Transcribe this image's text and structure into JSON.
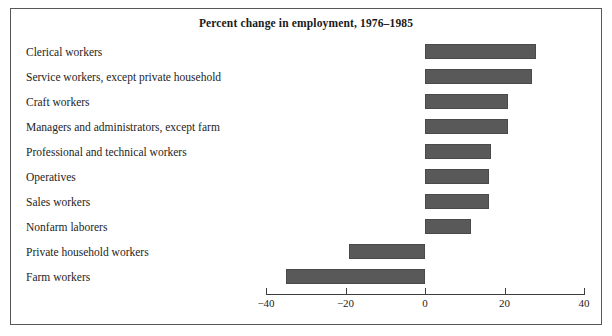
{
  "figure": {
    "title": "Percent change in employment, 1976–1985",
    "bar_color": "#595959",
    "frame_color": "#585858",
    "background": "#ffffff"
  },
  "chart_data": {
    "type": "bar",
    "orientation": "horizontal",
    "title": "Percent change in employment, 1976–1985",
    "xlabel": "",
    "ylabel": "",
    "xlim": [
      -40,
      40
    ],
    "grid": false,
    "legend": false,
    "xticks": [
      -40,
      -20,
      0,
      20,
      40
    ],
    "xtick_labels": [
      "−40",
      "−20",
      "0",
      "20",
      "40"
    ],
    "categories": [
      "Clerical workers",
      "Service workers, except private household",
      "Craft workers",
      "Managers and administrators, except farm",
      "Professional and technical workers",
      "Operatives",
      "Sales workers",
      "Nonfarm laborers",
      "Private household workers",
      "Farm workers"
    ],
    "values": [
      28,
      27,
      21,
      21,
      16.5,
      16,
      16,
      11.5,
      -19,
      -35
    ]
  }
}
